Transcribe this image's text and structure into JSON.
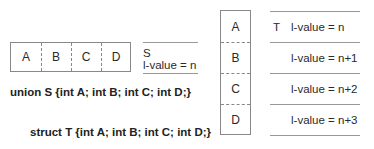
{
  "union_diagram": {
    "fields": [
      "A",
      "B",
      "C",
      "D"
    ],
    "name_label": "S",
    "lvalue_label": "l-value = n",
    "declaration": "union S {int A; int B; int C; int D;}"
  },
  "struct_diagram": {
    "fields": [
      "A",
      "B",
      "C",
      "D"
    ],
    "name_label": "T",
    "lvalue_labels": [
      "l-value = n",
      "l-value = n+1",
      "l-value = n+2",
      "l-value = n+3"
    ],
    "declaration": "struct T {int A; int B; int C; int D;}"
  }
}
